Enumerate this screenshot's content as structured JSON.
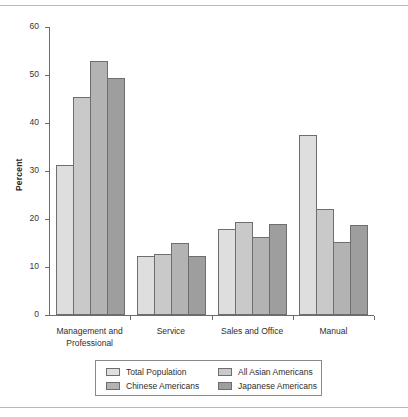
{
  "chart_data": {
    "type": "bar",
    "title": "",
    "xlabel": "",
    "ylabel": "Percent",
    "ylim": [
      0,
      60
    ],
    "ytick_labels": [
      "60",
      "50",
      "40",
      "30",
      "20",
      "10",
      "0"
    ],
    "yticks": [
      60,
      50,
      40,
      30,
      20,
      10,
      0
    ],
    "grid": false,
    "legend_position": "bottom",
    "categories": [
      "Management and\nProfessional",
      "Service",
      "Sales and Office",
      "Manual"
    ],
    "series": [
      {
        "name": "Total Population",
        "color": "#dedede",
        "values": [
          31.3,
          12.2,
          18.0,
          37.6
        ]
      },
      {
        "name": "All Asian Americans",
        "color": "#c9c9c9",
        "values": [
          45.4,
          12.7,
          19.4,
          22.1
        ]
      },
      {
        "name": "Chinese Americans",
        "color": "#b3b3b3",
        "values": [
          53.0,
          15.1,
          16.3,
          15.3
        ]
      },
      {
        "name": "Japanese Americans",
        "color": "#9e9e9e",
        "values": [
          49.4,
          12.2,
          19.0,
          18.8
        ]
      }
    ],
    "legend_order": [
      "Total Population",
      "All Asian Americans",
      "Chinese Americans",
      "Japanese Americans"
    ]
  }
}
